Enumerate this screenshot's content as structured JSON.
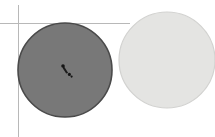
{
  "canvas": {
    "width": 215,
    "height": 137,
    "background_color": "#ffffff",
    "caption": ""
  },
  "guides": {
    "color": "#b8b8b8",
    "stroke_width": 1,
    "vertical_line": {
      "name": "vertical-guide-line",
      "x": 18.5,
      "y_start": 5,
      "y_end": 137
    },
    "horizontal_line": {
      "name": "horizontal-guide-line",
      "x_start": 0,
      "x_end": 130,
      "y": 23.5
    },
    "intersection": {
      "x": 18.5,
      "y": 23.5
    }
  },
  "shapes": [
    {
      "name": "dark-disc",
      "label": "dark gray circle",
      "type": "circle",
      "cx": 65,
      "cy": 70,
      "r": 47,
      "fill": "#787878",
      "stroke": "#4a4a4a",
      "stroke_width": 1.6
    },
    {
      "name": "light-disc",
      "label": "light gray circle",
      "type": "circle",
      "cx": 167,
      "cy": 60,
      "r": 48,
      "fill": "#e4e4e2",
      "stroke": "#d2d2d0",
      "stroke_width": 1.2
    }
  ],
  "marker": {
    "name": "cursor-marker",
    "label": "pointer marker",
    "x": 66,
    "y": 70,
    "color": "#151515",
    "dot_radius": 1.8,
    "tail_color": "#1c1c1c"
  }
}
